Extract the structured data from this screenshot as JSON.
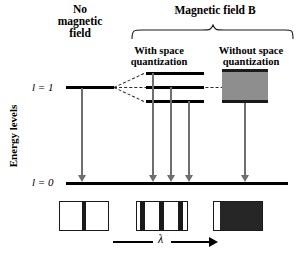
{
  "figure": {
    "title_no_field": "No\nmagnetic\nfield",
    "title_field": "Magnetic field B",
    "subtitle_with_quantization": "With space\nquantization",
    "subtitle_without_quantization": "Without space\nquantization",
    "y_axis_label": "Energy levels",
    "x_axis_symbol": "λ",
    "levels": [
      {
        "name": "upper-level",
        "label": "l = 1"
      },
      {
        "name": "ground-level",
        "label": "l = 0"
      }
    ],
    "colors": {
      "level_line": "#000000",
      "arrow": "#6e6e6e",
      "spectrum_line": "#1a1a1a",
      "broad_band": "#8e8e8e",
      "background": "#ffffff"
    },
    "split_levels_count": 3,
    "transitions_no_field": 1,
    "transitions_with_quantization": 3,
    "transitions_without_quantization": 1,
    "spectra": [
      {
        "name": "spectrum-no-field",
        "lines": 1
      },
      {
        "name": "spectrum-with-quantization",
        "lines": 3
      },
      {
        "name": "spectrum-without-quantization",
        "lines": 1,
        "broadened": true
      }
    ]
  }
}
